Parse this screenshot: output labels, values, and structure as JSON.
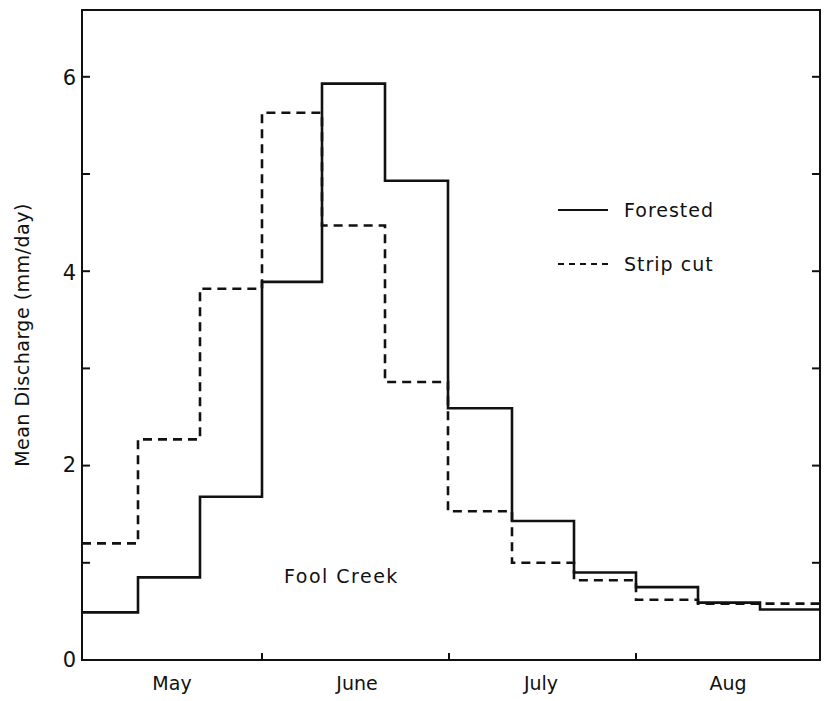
{
  "chart_data": {
    "type": "line",
    "subtype": "step",
    "title": "",
    "annotation": "Fool Creek",
    "xlabel": "",
    "ylabel": "Mean Discharge (mm/day)",
    "ylim": [
      0,
      6.7
    ],
    "yticks": [
      0,
      1,
      2,
      3,
      4,
      5,
      6
    ],
    "ytick_labels": [
      "0",
      "",
      "2",
      "",
      "4",
      "",
      "6"
    ],
    "x_month_labels": [
      "May",
      "June",
      "July",
      "Aug"
    ],
    "x_period_edges": [
      "May 1",
      "May 10",
      "May 20",
      "June 1",
      "June 10",
      "June 20",
      "July 1",
      "July 10",
      "July 20",
      "Aug 1",
      "Aug 10",
      "Aug 20",
      "Aug 31"
    ],
    "grid": false,
    "legend_position": "upper right",
    "series": [
      {
        "name": "Forested",
        "style": "solid",
        "values": [
          0.49,
          0.85,
          1.68,
          3.89,
          5.93,
          4.93,
          2.59,
          1.43,
          0.9,
          0.75,
          0.59,
          0.52
        ]
      },
      {
        "name": "Strip cut",
        "style": "dashed",
        "values": [
          1.2,
          2.27,
          3.82,
          5.63,
          4.47,
          2.86,
          1.53,
          1.0,
          0.82,
          0.62,
          0.58,
          0.58
        ]
      }
    ]
  },
  "labels": {
    "ylabel": "Mean Discharge (mm/day)",
    "annotation": "Fool Creek",
    "yticks": [
      "0",
      "2",
      "4",
      "6"
    ],
    "months": [
      "May",
      "June",
      "July",
      "Aug"
    ],
    "legend": [
      "Forested",
      "Strip cut"
    ]
  },
  "colors": {
    "line": "#111111",
    "background": "#ffffff"
  }
}
